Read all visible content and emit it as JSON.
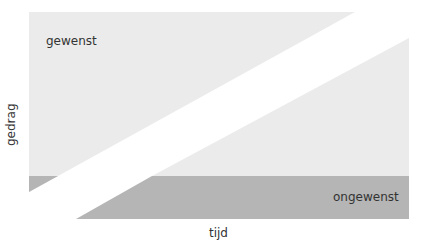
{
  "diagram": {
    "labels": {
      "desired": "gewenst",
      "undesired": "ongewenst",
      "x_axis": "tijd",
      "y_axis": "gedrag"
    },
    "colors": {
      "light_region": "#ebebeb",
      "dark_band": "#b5b5b5",
      "dark_band_on_left": "#b5b5b5",
      "gap": "#ffffff",
      "text": "#333333"
    }
  }
}
